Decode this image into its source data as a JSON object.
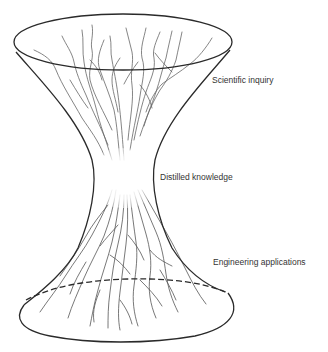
{
  "diagram": {
    "type": "hourglass-branching-diagram",
    "labels": {
      "top": "Scientific inquiry",
      "middle": "Distilled knowledge",
      "bottom": "Engineering applications"
    },
    "colors": {
      "outline": "#2a2a2a",
      "branches": "#555555",
      "text": "#333333"
    }
  }
}
